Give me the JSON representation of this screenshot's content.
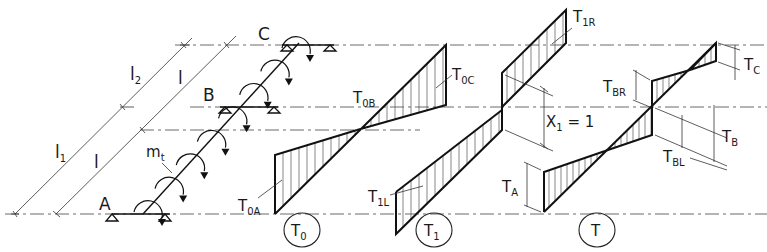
{
  "diagram": {
    "supports": {
      "A": "A",
      "B": "B",
      "C": "C"
    },
    "load_label": {
      "main": "m",
      "sub": "t"
    },
    "dimensions": {
      "l1": {
        "main": "l",
        "sub": "1"
      },
      "l2": {
        "main": "l",
        "sub": "2"
      },
      "l_lower": "l",
      "l_upper": "l"
    },
    "diagram_T0": {
      "tag": {
        "main": "T",
        "sub": "0"
      },
      "labels": {
        "T0A": {
          "main": "T",
          "sub": "0A"
        },
        "T0B": {
          "main": "T",
          "sub": "0B"
        },
        "T0C": {
          "main": "T",
          "sub": "0C"
        }
      }
    },
    "diagram_T1": {
      "tag": {
        "main": "T",
        "sub": "1"
      },
      "labels": {
        "T1L": {
          "main": "T",
          "sub": "1L"
        },
        "T1R": {
          "main": "T",
          "sub": "1R"
        }
      },
      "unit_value": {
        "main": "X",
        "sub": "1",
        "rest": " = 1"
      }
    },
    "diagram_T": {
      "tag": {
        "main": "T",
        "sub": ""
      },
      "labels": {
        "TA": {
          "main": "T",
          "sub": "A"
        },
        "TB": {
          "main": "T",
          "sub": "B"
        },
        "TBL": {
          "main": "T",
          "sub": "BL"
        },
        "TBR": {
          "main": "T",
          "sub": "BR"
        },
        "TC": {
          "main": "T",
          "sub": "C"
        }
      }
    }
  }
}
